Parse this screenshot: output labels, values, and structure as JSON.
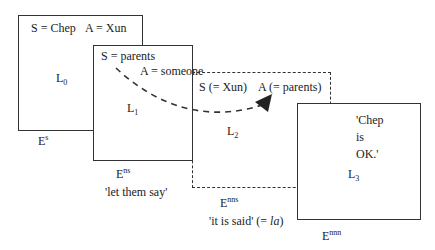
{
  "frames": [
    {
      "id": "L0",
      "level_base": "L",
      "level_sub": "0",
      "speaker": "S = Chep",
      "addressee": "A = Xun",
      "event_base": "E",
      "event_sup": "s",
      "gloss": ""
    },
    {
      "id": "L1",
      "level_base": "L",
      "level_sub": "1",
      "speaker": "S = parents",
      "addressee": "A = someone",
      "event_base": "E",
      "event_sup": "ns",
      "gloss": "'let them say'"
    },
    {
      "id": "L2",
      "level_base": "L",
      "level_sub": "2",
      "speaker": "S (= Xun)",
      "addressee": "A (= parents)",
      "event_base": "E",
      "event_sup": "nns",
      "gloss_main": "'it is said' (= ",
      "gloss_italic": "la",
      "gloss_end": ")"
    },
    {
      "id": "L3",
      "level_base": "L",
      "level_sub": "3",
      "quote": "'Chep\nis\nOK.'",
      "event_base": "E",
      "event_sup": "nnn"
    }
  ],
  "colors": {
    "line": "#333333",
    "background": "#ffffff"
  }
}
